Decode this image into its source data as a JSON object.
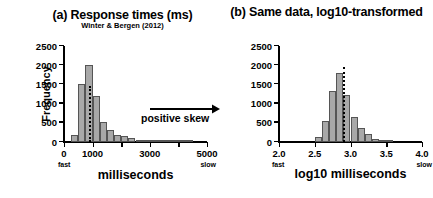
{
  "figure": {
    "caption_a": "(a) Response times (ms)",
    "subtitle_a": "Winter & Bergen (2012)",
    "caption_b": "(b) Same data, log10-transformed",
    "annotation_label": "positive skew",
    "bar_fill": "#a8a8a8",
    "bar_stroke": "#555555",
    "median_line_color": "#000000"
  },
  "chart_data": [
    {
      "type": "bar",
      "title": "(a) Response times (ms)",
      "subtitle": "Winter & Bergen (2012)",
      "xlabel": "milliseconds",
      "ylabel": "Frequency",
      "xlim": [
        0,
        5000
      ],
      "ylim": [
        0,
        2500
      ],
      "grid": false,
      "legend": null,
      "xticks": [
        0,
        1000,
        2000,
        3000,
        4000,
        5000
      ],
      "xticklabels": [
        "0",
        "1000",
        "",
        "3000",
        "",
        "5000"
      ],
      "yticks": [
        0,
        500,
        1000,
        1500,
        2000,
        2500
      ],
      "yticklabels": [
        "0",
        "500",
        "1000",
        "1500",
        "2000",
        "2500"
      ],
      "x_axis_end_labels": {
        "left": "fast",
        "right": "slow"
      },
      "bin_width": 250,
      "bin_starts": [
        250,
        500,
        750,
        1000,
        1250,
        1500,
        1750,
        2000,
        2250,
        2500,
        2750,
        3000,
        3250,
        3500,
        3750,
        4000,
        4250
      ],
      "values": [
        170,
        1500,
        2000,
        1200,
        520,
        300,
        190,
        150,
        95,
        60,
        45,
        30,
        22,
        15,
        12,
        8,
        5
      ],
      "median_line_x": 870,
      "annotations": [
        {
          "text": "positive skew",
          "type": "arrow-right",
          "x_start": 1750,
          "x_end": 4300,
          "y": 1200
        }
      ]
    },
    {
      "type": "bar",
      "title": "(b) Same data, log10-transformed",
      "xlabel": "log10 milliseconds",
      "ylabel": "Frequency",
      "xlim": [
        2.0,
        4.0
      ],
      "ylim": [
        0,
        2500
      ],
      "grid": false,
      "legend": null,
      "xticks": [
        2.0,
        2.5,
        3.0,
        3.5,
        4.0
      ],
      "xticklabels": [
        "2.0",
        "2.5",
        "3.0",
        "3.5",
        "4.0"
      ],
      "yticks": [
        0,
        500,
        1000,
        1500,
        2000,
        2500
      ],
      "yticklabels": [
        "0",
        "500",
        "1000",
        "1500",
        "2000",
        "2500"
      ],
      "x_axis_end_labels": {
        "left": "fast",
        "right": "slow"
      },
      "bin_width": 0.1,
      "bin_starts": [
        2.5,
        2.6,
        2.7,
        2.8,
        2.9,
        3.0,
        3.1,
        3.2,
        3.3,
        3.4,
        3.5
      ],
      "values": [
        140,
        560,
        1320,
        1800,
        1230,
        640,
        370,
        200,
        90,
        40,
        20
      ],
      "median_line_x": 2.89,
      "annotations": []
    }
  ]
}
